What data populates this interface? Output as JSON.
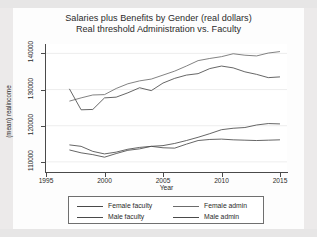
{
  "chart_data": {
    "type": "line",
    "title": "Salaries plus Benefits by Gender (real dollars)",
    "subtitle": "Real threshold Administration vs. Faculty",
    "xlabel": "Year",
    "ylabel": "(mean) realincome",
    "xlim": [
      1995,
      2015.6
    ],
    "ylim": [
      107200,
      142600
    ],
    "xticks": [
      1995,
      2000,
      2005,
      2010,
      2015
    ],
    "xtick_labels": [
      "1995",
      "2000",
      "2005",
      "2010",
      "2015"
    ],
    "yticks": [
      110000,
      120000,
      130000,
      140000
    ],
    "ytick_labels": [
      "110000",
      "120000",
      "130000",
      "140000"
    ],
    "grid": "horizontal-faint",
    "legend_position": "below-plot",
    "x": [
      1997,
      1998,
      1999,
      2000,
      2001,
      2002,
      2003,
      2004,
      2005,
      2006,
      2007,
      2008,
      2009,
      2010,
      2011,
      2012,
      2013,
      2014,
      2015
    ],
    "series": [
      {
        "name": "Female faculty",
        "color": "#4a4a4a",
        "values": [
          114700,
          114300,
          112900,
          112200,
          112700,
          113500,
          114000,
          114300,
          113900,
          113800,
          114900,
          115900,
          116200,
          116300,
          116100,
          116000,
          115900,
          116000,
          116100
        ]
      },
      {
        "name": "Male faculty",
        "color": "#4a4a4a",
        "values": [
          113300,
          112500,
          112000,
          111300,
          112300,
          113200,
          113600,
          114300,
          114500,
          115100,
          115900,
          116800,
          117800,
          118900,
          119300,
          119500,
          120200,
          120600,
          120500
        ]
      },
      {
        "name": "Female admin",
        "color": "#6b6b6b",
        "values": [
          126800,
          127700,
          128500,
          128600,
          130300,
          131600,
          132400,
          132900,
          134000,
          135100,
          136500,
          138000,
          138600,
          139100,
          139900,
          139500,
          139300,
          140100,
          140500
        ]
      },
      {
        "name": "Male admin",
        "color": "#4a4a4a",
        "values": [
          130200,
          124400,
          124500,
          127700,
          127900,
          129100,
          130500,
          129700,
          131800,
          133100,
          134000,
          134400,
          135800,
          136500,
          136000,
          134900,
          134200,
          133300,
          133500
        ]
      }
    ]
  },
  "axis": {
    "y_title": "(mean) realincome",
    "x_title": "Year"
  },
  "legend": {
    "entries": [
      {
        "label": "Female faculty"
      },
      {
        "label": "Female admin"
      },
      {
        "label": "Male faculty"
      },
      {
        "label": "Male admin"
      }
    ]
  }
}
